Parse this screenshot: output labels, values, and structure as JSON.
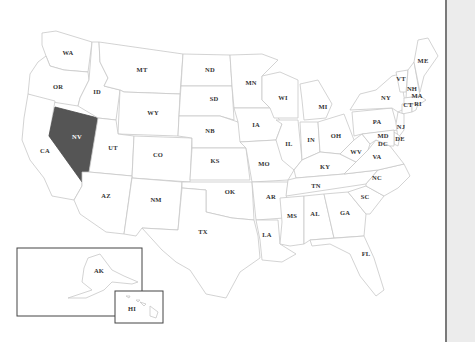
{
  "map": {
    "title": "United States map",
    "selected_state": "NV",
    "colors": {
      "selected_fill": "#555555",
      "default_fill": "#ffffff",
      "border": "#c8c8c8",
      "label": "#333333",
      "selected_label": "#ffffff",
      "panel_bg": "#ececec",
      "panel_border": "#7a7a7a"
    },
    "states": {
      "WA": "WA",
      "OR": "OR",
      "CA": "CA",
      "NV": "NV",
      "ID": "ID",
      "MT": "MT",
      "WY": "WY",
      "UT": "UT",
      "AZ": "AZ",
      "CO": "CO",
      "NM": "NM",
      "ND": "ND",
      "SD": "SD",
      "NB": "NB",
      "KS": "KS",
      "OK": "OK",
      "TX": "TX",
      "MN": "MN",
      "IA": "IA",
      "MO": "MO",
      "AR": "AR",
      "LA": "LA",
      "WI": "WI",
      "IL": "IL",
      "MI": "MI",
      "IN": "IN",
      "OH": "OH",
      "KY": "KY",
      "TN": "TN",
      "MS": "MS",
      "AL": "AL",
      "GA": "GA",
      "FL": "FL",
      "SC": "SC",
      "NC": "NC",
      "VA": "VA",
      "WV": "WV",
      "PA": "PA",
      "NY": "NY",
      "VT": "VT",
      "NH": "NH",
      "ME": "ME",
      "MA": "MA",
      "CT": "CT",
      "RI": "RI",
      "NJ": "NJ",
      "DE": "DE",
      "MD": "MD",
      "DC": "DC",
      "AK": "AK",
      "HI": "HI"
    }
  }
}
